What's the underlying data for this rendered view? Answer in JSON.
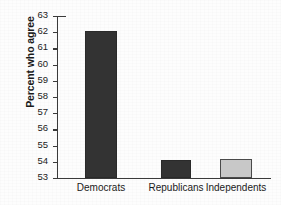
{
  "chart_data": {
    "type": "bar",
    "title": "",
    "xlabel": "",
    "ylabel": "Percent who agree",
    "categories": [
      "Democrats",
      "Republicans",
      "Independents"
    ],
    "values": [
      62.1,
      54.1,
      54.2
    ],
    "ylim": [
      53,
      63
    ],
    "yticks": [
      53,
      54,
      55,
      56,
      57,
      58,
      59,
      60,
      61,
      62,
      63
    ],
    "ytick_labels": [
      "53",
      "54",
      "55",
      "56",
      "57",
      "58",
      "59",
      "60",
      "61",
      "62",
      "63"
    ],
    "grid": false,
    "legend": null,
    "bar_colors": [
      "#333333",
      "#333333",
      "#c8c8c8"
    ],
    "bar_edge_colors": [
      "#2a2a2a",
      "#2a2a2a",
      "#4a4a4a"
    ],
    "axis_color": "#3a3a3a",
    "background": "#fdfdfd"
  }
}
